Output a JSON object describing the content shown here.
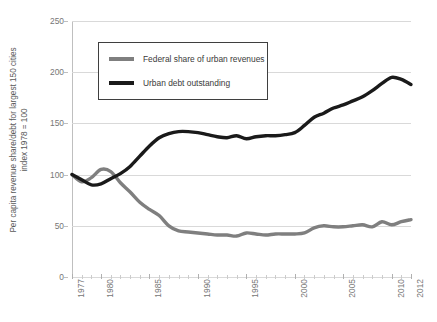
{
  "chart_data": {
    "type": "line",
    "title": "",
    "xlabel": "",
    "ylabel": "Per capita revenue share/debt for largest 150 cities",
    "ylabel_line2": "index 1978 = 100",
    "xlim": [
      1977,
      2012
    ],
    "ylim": [
      0,
      250
    ],
    "ytick_labels": [
      "0",
      "50",
      "100",
      "150",
      "200",
      "250"
    ],
    "ytick_values": [
      0,
      50,
      100,
      150,
      200,
      250
    ],
    "xtick_labels": [
      "1977",
      "1980",
      "1985",
      "1990",
      "1995",
      "2000",
      "2005",
      "2010",
      "2012"
    ],
    "xtick_values": [
      1977,
      1980,
      1985,
      1990,
      1995,
      2000,
      2005,
      2010,
      2012
    ],
    "grid": "horizontal",
    "legend_position": "upper-left-inside",
    "x": [
      1977,
      1978,
      1979,
      1980,
      1981,
      1982,
      1983,
      1984,
      1985,
      1986,
      1987,
      1988,
      1989,
      1990,
      1991,
      1992,
      1993,
      1994,
      1995,
      1996,
      1997,
      1998,
      1999,
      2000,
      2001,
      2002,
      2003,
      2004,
      2005,
      2006,
      2007,
      2008,
      2009,
      2010,
      2011,
      2012
    ],
    "series": [
      {
        "name": "Federal share of urban revenues",
        "color": "#7f7f7f",
        "values": [
          100,
          93,
          97,
          105,
          103,
          92,
          83,
          73,
          66,
          60,
          50,
          45,
          44,
          43,
          42,
          41,
          41,
          40,
          43,
          42,
          41,
          42,
          42,
          42,
          43,
          48,
          50,
          49,
          49,
          50,
          51,
          49,
          54,
          51,
          54,
          56
        ]
      },
      {
        "name": "Urban debt outstanding",
        "color": "#1a1a1a",
        "values": [
          100,
          95,
          90,
          91,
          96,
          101,
          108,
          118,
          128,
          136,
          140,
          142,
          142,
          141,
          139,
          137,
          136,
          138,
          135,
          137,
          138,
          138,
          139,
          141,
          148,
          156,
          160,
          165,
          168,
          172,
          176,
          182,
          189,
          195,
          193,
          188
        ]
      }
    ]
  },
  "legend": {
    "items": [
      {
        "label": "Federal share of urban revenues",
        "color": "#7f7f7f"
      },
      {
        "label": "Urban debt outstanding",
        "color": "#1a1a1a"
      }
    ]
  },
  "axes": {
    "y_title_line1": "Per capita revenue share/debt for largest 150 cities",
    "y_title_line2": "index 1978 = 100"
  }
}
